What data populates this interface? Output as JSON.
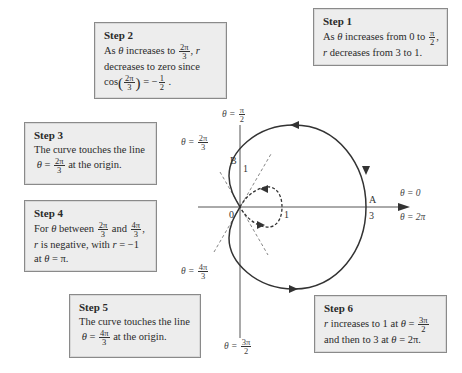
{
  "steps": [
    {
      "id": 1,
      "title": "Step 1",
      "line1_pre": "As ",
      "theta": "θ",
      "line1_mid": " increases from 0 to ",
      "frac_num": "π",
      "frac_den": "2",
      "line1_post": ",",
      "line2_r": "r",
      "line2": " decreases from 3 to 1."
    },
    {
      "id": 2,
      "title": "Step 2",
      "line1_pre": "As ",
      "theta": "θ",
      "line1_mid": " increases to ",
      "frac_num": "2π",
      "frac_den": "3",
      "line1_post": ", ",
      "r": "r",
      "line2": "decreases to zero since",
      "cos": "cos",
      "cos_num": "2π",
      "cos_den": "3",
      "eq_val": " = −",
      "half_num": "1",
      "half_den": "2",
      "end": " ."
    },
    {
      "id": 3,
      "title": "Step 3",
      "line1": "The curve touches the line",
      "theta": "θ",
      "eq": " = ",
      "frac_num": "2π",
      "frac_den": "3",
      "line2_post": "  at the origin."
    },
    {
      "id": 4,
      "title": "Step 4",
      "pre": "For ",
      "theta": "θ",
      "between": " between ",
      "a_num": "2π",
      "a_den": "3",
      "and": " and ",
      "b_num": "4π",
      "b_den": "3",
      "comma": ",",
      "r": "r",
      "neg": " is negative, with ",
      "r2": "r",
      "val": " = −1",
      "at": "at ",
      "theta2": "θ",
      "pi": " = π."
    },
    {
      "id": 5,
      "title": "Step 5",
      "line1": "The curve touches the line",
      "theta": "θ",
      "eq": " = ",
      "frac_num": "4π",
      "frac_den": "3",
      "line2_post": "  at the origin."
    },
    {
      "id": 6,
      "title": "Step 6",
      "r": "r",
      "l1": " increases to 1 at ",
      "theta": "θ",
      "eq": " = ",
      "frac_num": "3π",
      "frac_den": "2",
      "l2": "and then to 3 at ",
      "theta2": "θ",
      "l2_end": " = 2π."
    }
  ],
  "graph": {
    "equation_implied": "r = 1 + 2cos θ",
    "origin_label": "0",
    "point_A": "A",
    "point_A_value": "3",
    "point_B": "B",
    "point_B_value": "1",
    "inner_loop_value": "1",
    "angle_labels": {
      "theta_0": "θ = 0",
      "theta_2pi": "θ = 2π",
      "theta_pi_over_2": {
        "lhs": "θ = ",
        "num": "π",
        "den": "2"
      },
      "theta_2pi_over_3": {
        "lhs": "θ = ",
        "num": "2π",
        "den": "3"
      },
      "theta_4pi_over_3": {
        "lhs": "θ = ",
        "num": "4π",
        "den": "3"
      },
      "theta_3pi_over_2": {
        "lhs": "θ = ",
        "num": "3π",
        "den": "2"
      }
    },
    "colors": {
      "curve": "#333333",
      "axis": "#555555",
      "dashed": "#777777",
      "box_fill": "#ededed",
      "box_border": "#8a8a8a"
    }
  }
}
